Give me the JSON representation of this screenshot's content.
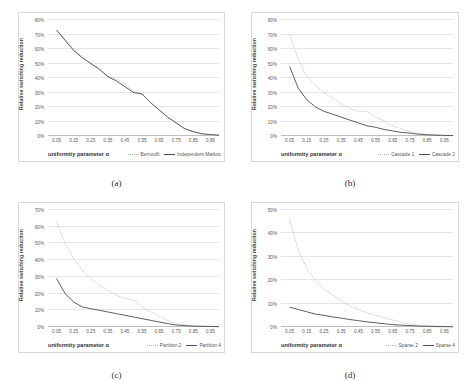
{
  "figure": {
    "background": "#ffffff",
    "series_colors": {
      "dotted": "#b3b3b3",
      "solid": "#4d4d4d"
    }
  },
  "panels": [
    {
      "id": "a",
      "caption": "(a)",
      "xlabel": "uniformity parameter α",
      "ylabel": "Relative switching reduction"
    },
    {
      "id": "b",
      "caption": "(b)",
      "xlabel": "uniformity parameter α",
      "ylabel": "Relative switching reduction"
    },
    {
      "id": "c",
      "caption": "(c)",
      "xlabel": "uniformity parameter α",
      "ylabel": "Relative switching reduction"
    },
    {
      "id": "d",
      "caption": "(d)",
      "xlabel": "uniformity parameter α",
      "ylabel": "Relative switching reduction"
    }
  ],
  "chart_data": [
    {
      "type": "line",
      "panel": "a",
      "title": "",
      "xlabel": "uniformity parameter α",
      "ylabel": "Relative switching reduction",
      "x": [
        0.05,
        0.15,
        0.25,
        0.35,
        0.45,
        0.55,
        0.65,
        0.75,
        0.85,
        0.95
      ],
      "xticklabels": [
        "0.05",
        "0.15",
        "0.25",
        "0.35",
        "0.45",
        "0.55",
        "0.65",
        "0.75",
        "0.85",
        "0.95"
      ],
      "yticklabels": [
        "0%",
        "10%",
        "20%",
        "30%",
        "40%",
        "50%",
        "60%",
        "70%",
        "80%"
      ],
      "ylim": [
        0,
        80
      ],
      "xlim": [
        0.0,
        1.0
      ],
      "grid": true,
      "legend_position": "below-right",
      "series": [
        {
          "name": "Bernoulli",
          "style": "dotted",
          "color": "#b3b3b3",
          "x": [
            0.05,
            0.1,
            0.15,
            0.2,
            0.25,
            0.3,
            0.35,
            0.4,
            0.45,
            0.5,
            0.55,
            0.6,
            0.65,
            0.7,
            0.75,
            0.8,
            0.85,
            0.9,
            0.95,
            1.0
          ],
          "values": [
            73,
            67,
            60,
            55,
            50,
            47,
            41,
            39,
            36,
            31,
            29,
            23,
            18,
            13,
            9,
            5,
            3,
            1.5,
            1,
            0.6
          ]
        },
        {
          "name": "Independent Markov",
          "style": "solid",
          "color": "#4d4d4d",
          "x": [
            0.05,
            0.1,
            0.15,
            0.2,
            0.25,
            0.3,
            0.35,
            0.4,
            0.45,
            0.5,
            0.55,
            0.6,
            0.65,
            0.7,
            0.75,
            0.8,
            0.85,
            0.9,
            0.95,
            1.0
          ],
          "values": [
            73,
            66,
            59,
            54,
            50,
            46,
            41,
            38,
            34,
            30,
            29,
            23,
            18,
            13,
            9,
            5,
            3,
            1.5,
            1,
            0.6
          ]
        }
      ]
    },
    {
      "type": "line",
      "panel": "b",
      "title": "",
      "xlabel": "uniformity parameter α",
      "ylabel": "Relative switching reduction",
      "x": [
        0.05,
        0.15,
        0.25,
        0.35,
        0.45,
        0.55,
        0.65,
        0.75,
        0.85,
        0.95
      ],
      "xticklabels": [
        "0.05",
        "0.15",
        "0.25",
        "0.35",
        "0.45",
        "0.55",
        "0.65",
        "0.75",
        "0.85",
        "0.95"
      ],
      "yticklabels": [
        "0%",
        "10%",
        "20%",
        "30%",
        "40%",
        "50%",
        "60%",
        "70%",
        "80%"
      ],
      "ylim": [
        0,
        80
      ],
      "xlim": [
        0.0,
        1.0
      ],
      "grid": true,
      "legend_position": "below-right",
      "series": [
        {
          "name": "Cascade 1",
          "style": "dotted",
          "color": "#b3b3b3",
          "x": [
            0.05,
            0.1,
            0.15,
            0.2,
            0.25,
            0.3,
            0.35,
            0.4,
            0.45,
            0.5,
            0.55,
            0.6,
            0.65,
            0.7,
            0.75,
            0.8,
            0.85,
            0.9,
            0.95,
            1.0
          ],
          "values": [
            70,
            53,
            41,
            35,
            30,
            26,
            22,
            19,
            17,
            17,
            13,
            10,
            7,
            5,
            3,
            2,
            1.2,
            0.8,
            0.5,
            0.4
          ]
        },
        {
          "name": "Cascade 2",
          "style": "solid",
          "color": "#4d4d4d",
          "x": [
            0.05,
            0.1,
            0.15,
            0.2,
            0.25,
            0.3,
            0.35,
            0.4,
            0.45,
            0.5,
            0.55,
            0.6,
            0.65,
            0.7,
            0.75,
            0.8,
            0.85,
            0.9,
            0.95,
            1.0
          ],
          "values": [
            48,
            33,
            25,
            20,
            17,
            15,
            13,
            11,
            9,
            7,
            6,
            4.5,
            3.5,
            2.5,
            2,
            1.2,
            0.8,
            0.6,
            0.4,
            0.3
          ]
        }
      ]
    },
    {
      "type": "line",
      "panel": "c",
      "title": "",
      "xlabel": "uniformity parameter α",
      "ylabel": "Relative switching reduction",
      "x": [
        0.05,
        0.15,
        0.25,
        0.35,
        0.45,
        0.55,
        0.65,
        0.75,
        0.85,
        0.95
      ],
      "xticklabels": [
        "0.05",
        "0.15",
        "0.25",
        "0.35",
        "0.45",
        "0.55",
        "0.65",
        "0.75",
        "0.85",
        "0.95"
      ],
      "yticklabels": [
        "0%",
        "10%",
        "20%",
        "30%",
        "40%",
        "50%",
        "60%",
        "70%"
      ],
      "ylim": [
        0,
        70
      ],
      "xlim": [
        0.0,
        1.0
      ],
      "grid": true,
      "legend_position": "below-right",
      "series": [
        {
          "name": "Partition 2",
          "style": "dotted",
          "color": "#b3b3b3",
          "x": [
            0.05,
            0.1,
            0.15,
            0.2,
            0.25,
            0.3,
            0.35,
            0.4,
            0.45,
            0.5,
            0.55,
            0.6,
            0.65,
            0.7,
            0.75,
            0.8,
            0.85,
            0.9,
            0.95,
            1.0
          ],
          "values": [
            63,
            50,
            41,
            34,
            29,
            25,
            22,
            19,
            17,
            16,
            12,
            9,
            6.5,
            4,
            2,
            1.2,
            0.8,
            0.5,
            0.4,
            0.3
          ]
        },
        {
          "name": "Partition 4",
          "style": "solid",
          "color": "#4d4d4d",
          "x": [
            0.05,
            0.1,
            0.15,
            0.2,
            0.25,
            0.3,
            0.35,
            0.4,
            0.45,
            0.5,
            0.55,
            0.6,
            0.65,
            0.7,
            0.75,
            0.8,
            0.85,
            0.9,
            0.95,
            1.0
          ],
          "values": [
            29,
            20,
            15,
            12,
            11,
            10,
            9,
            8,
            7,
            6,
            5,
            4,
            3,
            2,
            1.2,
            0.8,
            0.5,
            0.4,
            0.3,
            0.2
          ]
        }
      ]
    },
    {
      "type": "line",
      "panel": "d",
      "title": "",
      "xlabel": "uniformity parameter α",
      "ylabel": "Relative switching reduction",
      "x": [
        0.05,
        0.15,
        0.25,
        0.35,
        0.45,
        0.55,
        0.65,
        0.75,
        0.85,
        0.95
      ],
      "xticklabels": [
        "0.05",
        "0.15",
        "0.25",
        "0.35",
        "0.45",
        "0.55",
        "0.65",
        "0.75",
        "0.85",
        "0.95"
      ],
      "yticklabels": [
        "0%",
        "10%",
        "20%",
        "30%",
        "40%",
        "50%"
      ],
      "ylim": [
        0,
        50
      ],
      "xlim": [
        0.0,
        1.0
      ],
      "grid": true,
      "legend_position": "below-right",
      "series": [
        {
          "name": "Sparse 2",
          "style": "dotted",
          "color": "#b3b3b3",
          "x": [
            0.05,
            0.1,
            0.15,
            0.2,
            0.25,
            0.3,
            0.35,
            0.4,
            0.45,
            0.5,
            0.55,
            0.6,
            0.65,
            0.7,
            0.75,
            0.8,
            0.85,
            0.9,
            0.95,
            1.0
          ],
          "values": [
            46,
            33,
            25,
            20,
            16,
            14,
            11,
            9,
            7.5,
            6,
            5,
            4,
            3,
            2,
            1.2,
            0.8,
            0.5,
            0.4,
            0.3,
            0.2
          ]
        },
        {
          "name": "Sparse 4",
          "style": "solid",
          "color": "#4d4d4d",
          "x": [
            0.05,
            0.1,
            0.15,
            0.2,
            0.25,
            0.3,
            0.35,
            0.4,
            0.45,
            0.5,
            0.55,
            0.6,
            0.65,
            0.7,
            0.75,
            0.8,
            0.85,
            0.9,
            0.95,
            1.0
          ],
          "values": [
            8.5,
            7.5,
            6.5,
            5.5,
            5,
            4.3,
            3.8,
            3.2,
            2.7,
            2.2,
            1.8,
            1.4,
            1.0,
            0.8,
            0.6,
            0.4,
            0.3,
            0.2,
            0.15,
            0.1
          ]
        }
      ]
    }
  ]
}
